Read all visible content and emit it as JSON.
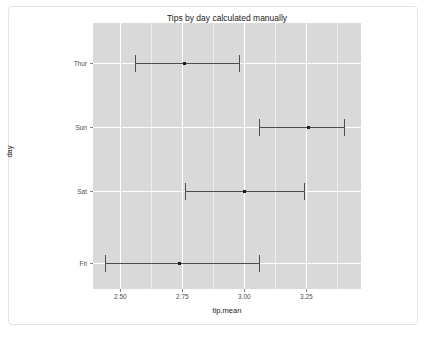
{
  "chart_data": {
    "type": "scatter",
    "title": "Tips by day calculated manually",
    "xlabel": "tip.mean",
    "ylabel": "day",
    "orientation": "horizontal",
    "grid": true,
    "legend": false,
    "categories": [
      "Thur",
      "Sun",
      "Sat",
      "Fri"
    ],
    "xlim": [
      2.39,
      3.47
    ],
    "xticks": [
      2.5,
      2.75,
      3.0,
      3.25
    ],
    "xtick_labels": [
      "2.50",
      "2.75",
      "3.00",
      "3.25"
    ],
    "values": [
      2.76,
      3.26,
      3.0,
      2.74
    ],
    "error_low": [
      2.56,
      3.06,
      2.76,
      2.44
    ],
    "error_high": [
      2.98,
      3.4,
      3.24,
      3.06
    ],
    "points": [
      {
        "category": "Thur",
        "mean": 2.76,
        "low": 2.56,
        "high": 2.98
      },
      {
        "category": "Sun",
        "mean": 3.26,
        "low": 3.06,
        "high": 3.4
      },
      {
        "category": "Sat",
        "mean": 3.0,
        "low": 2.76,
        "high": 3.24
      },
      {
        "category": "Fri",
        "mean": 2.74,
        "low": 2.44,
        "high": 3.06
      }
    ],
    "colors": {
      "panel_background": "#d9d9d9",
      "gridline": "#ffffff",
      "marker": "#1a1a1a",
      "errorbar": "#4d4d4d",
      "text": "#1a1a1a",
      "card_background": "#ffffff",
      "card_border": "#e3e3e3"
    }
  }
}
